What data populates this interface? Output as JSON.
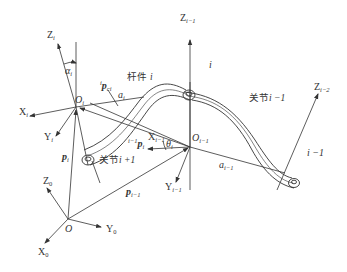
{
  "diagram": {
    "title": "",
    "colors": {
      "stroke": "#333333",
      "background": "#ffffff"
    },
    "frames": [
      {
        "origin": "O_i",
        "axes": [
          "X_i",
          "Y_i",
          "Z_i"
        ]
      },
      {
        "origin": "O_{i-1}",
        "axes": [
          "X_{i-1}",
          "Y_{i-1}",
          "Z_{i-1}"
        ]
      },
      {
        "origin": "O",
        "axes": [
          "X_0",
          "Y_0",
          "Z_0"
        ]
      },
      {
        "origin": "",
        "axes": [
          "Z_{i-2}"
        ]
      }
    ],
    "labels": {
      "Zi": "Z",
      "Zi_sub": "i",
      "alpha_i": "α",
      "alpha_i_sub": "i",
      "pci_pre": "i",
      "pci": "p",
      "pci_sub": "ci",
      "link_i": "杆件",
      "link_i_var": "i",
      "Oi": "O",
      "Oi_sub": "i",
      "ai": "a",
      "ai_sub": "i",
      "Xi": "X",
      "Xi_sub": "i",
      "Yi": "Y",
      "Yi_sub": "i",
      "Xim1": "X",
      "Xim1_sub": "i−1",
      "ip_pre": "i−1",
      "ip": "p",
      "ip_sub": "i",
      "theta": "θ",
      "theta_sub": "i",
      "Oim1": "O",
      "Oim1_sub": "i−1",
      "pi": "p",
      "pi_sub": "i",
      "joint_ip1": "关节",
      "joint_ip1_var": "i +1",
      "Zim1": "Z",
      "Zim1_sub": "i−1",
      "top_i": "i",
      "joint_im1": "关节",
      "joint_im1_var": "i −1",
      "Zim2": "Z",
      "Zim2_sub": "i−2",
      "right_im1": "i −1",
      "aim1": "a",
      "aim1_sub": "i−1",
      "Yim1": "Y",
      "Yim1_sub": "i−1",
      "pim1": "p",
      "pim1_sub": "i−1",
      "Z0": "Z",
      "Z0_sub": "0",
      "O": "O",
      "Y0": "Y",
      "Y0_sub": "0",
      "X0": "X",
      "X0_sub": "0"
    }
  }
}
